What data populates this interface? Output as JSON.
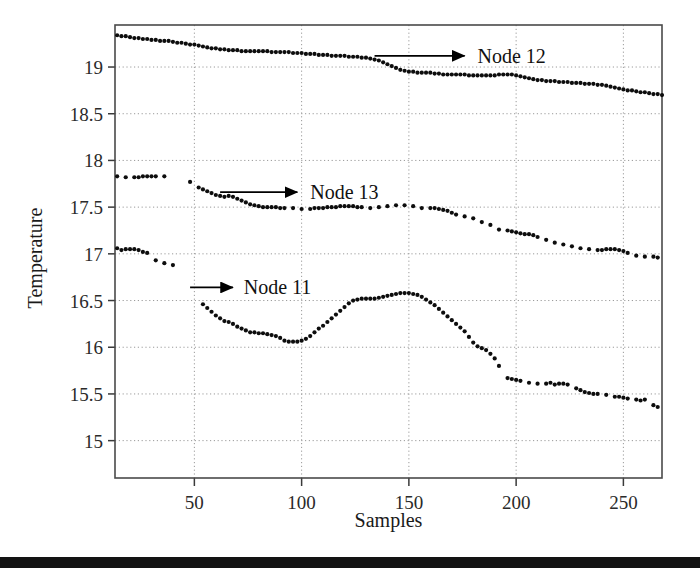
{
  "figure": {
    "background_color": "#ffffff",
    "point_color": "#0d0d0d",
    "grid_color": "#9a9a9a",
    "frame_color": "#4a4a4a"
  },
  "chart_data": {
    "type": "scatter",
    "title": "",
    "xlabel": "Samples",
    "ylabel": "Temperature",
    "xlim": [
      13,
      268
    ],
    "ylim": [
      14.6,
      19.45
    ],
    "xticks": [
      50,
      100,
      150,
      200,
      250
    ],
    "yticks": [
      15,
      15.5,
      16,
      16.5,
      17,
      17.5,
      18,
      18.5,
      19
    ],
    "xticklabels": [
      "50",
      "100",
      "150",
      "200",
      "250"
    ],
    "yticklabels": [
      "15",
      "15.5",
      "16",
      "16.5",
      "17",
      "17.5",
      "18",
      "18.5",
      "19"
    ],
    "grid": true,
    "legend": "annotations-with-arrows",
    "annotations": [
      {
        "text": "Node 12",
        "x": 182,
        "y": 19.12,
        "arrow_from_x": 134,
        "arrow_to_x": 176
      },
      {
        "text": "Node 13",
        "x": 104,
        "y": 17.66,
        "arrow_from_x": 62,
        "arrow_to_x": 98
      },
      {
        "text": "Node 11",
        "x": 73,
        "y": 16.64,
        "arrow_from_x": 48,
        "arrow_to_x": 68
      }
    ],
    "series": [
      {
        "name": "Node 12",
        "x": [
          14,
          16,
          18,
          20,
          22,
          24,
          26,
          28,
          30,
          32,
          34,
          36,
          38,
          40,
          42,
          44,
          46,
          48,
          50,
          52,
          54,
          56,
          58,
          60,
          62,
          64,
          66,
          68,
          70,
          72,
          74,
          76,
          78,
          80,
          82,
          84,
          86,
          88,
          90,
          92,
          94,
          96,
          98,
          100,
          102,
          104,
          106,
          108,
          110,
          112,
          114,
          116,
          118,
          120,
          122,
          124,
          126,
          128,
          130,
          132,
          134,
          136,
          138,
          140,
          142,
          144,
          146,
          148,
          150,
          152,
          154,
          156,
          158,
          160,
          162,
          164,
          166,
          168,
          170,
          172,
          174,
          176,
          178,
          180,
          182,
          184,
          186,
          188,
          190,
          192,
          194,
          196,
          198,
          200,
          202,
          204,
          206,
          208,
          210,
          212,
          214,
          216,
          218,
          220,
          222,
          224,
          226,
          228,
          230,
          232,
          234,
          236,
          238,
          240,
          242,
          244,
          246,
          248,
          250,
          252,
          254,
          256,
          258,
          260,
          262,
          264,
          266,
          268
        ],
        "y": [
          19.34,
          19.33,
          19.33,
          19.32,
          19.31,
          19.31,
          19.3,
          19.3,
          19.29,
          19.29,
          19.28,
          19.28,
          19.28,
          19.27,
          19.26,
          19.26,
          19.25,
          19.24,
          19.24,
          19.23,
          19.22,
          19.21,
          19.2,
          19.2,
          19.19,
          19.19,
          19.18,
          19.18,
          19.18,
          19.17,
          19.17,
          19.17,
          19.17,
          19.17,
          19.17,
          19.17,
          19.16,
          19.16,
          19.16,
          19.16,
          19.16,
          19.15,
          19.15,
          19.15,
          19.14,
          19.14,
          19.14,
          19.13,
          19.13,
          19.13,
          19.12,
          19.12,
          19.12,
          19.12,
          19.11,
          19.11,
          19.11,
          19.1,
          19.1,
          19.09,
          19.08,
          19.07,
          19.05,
          19.03,
          19.01,
          18.99,
          18.97,
          18.96,
          18.95,
          18.95,
          18.94,
          18.94,
          18.94,
          18.94,
          18.93,
          18.93,
          18.92,
          18.92,
          18.92,
          18.92,
          18.92,
          18.92,
          18.91,
          18.91,
          18.91,
          18.91,
          18.91,
          18.91,
          18.91,
          18.92,
          18.92,
          18.92,
          18.92,
          18.91,
          18.9,
          18.89,
          18.88,
          18.87,
          18.86,
          18.86,
          18.85,
          18.85,
          18.85,
          18.84,
          18.84,
          18.84,
          18.83,
          18.83,
          18.83,
          18.82,
          18.82,
          18.82,
          18.81,
          18.81,
          18.8,
          18.79,
          18.78,
          18.77,
          18.76,
          18.75,
          18.75,
          18.74,
          18.73,
          18.73,
          18.72,
          18.71,
          18.71,
          18.7
        ]
      },
      {
        "name": "Node 13",
        "x": [
          14,
          18,
          22,
          24,
          26,
          28,
          30,
          32,
          36,
          48,
          52,
          54,
          56,
          58,
          60,
          62,
          64,
          66,
          68,
          70,
          72,
          74,
          76,
          78,
          80,
          82,
          84,
          86,
          88,
          90,
          92,
          96,
          100,
          104,
          106,
          108,
          110,
          112,
          114,
          116,
          118,
          120,
          122,
          124,
          126,
          128,
          132,
          136,
          140,
          144,
          148,
          152,
          156,
          160,
          162,
          164,
          166,
          168,
          170,
          172,
          176,
          180,
          184,
          188,
          192,
          196,
          198,
          200,
          202,
          204,
          206,
          208,
          210,
          214,
          218,
          222,
          226,
          230,
          234,
          238,
          240,
          242,
          244,
          246,
          248,
          250,
          252,
          256,
          260,
          264,
          266
        ],
        "y": [
          17.83,
          17.82,
          17.82,
          17.82,
          17.83,
          17.83,
          17.83,
          17.83,
          17.83,
          17.77,
          17.71,
          17.69,
          17.67,
          17.65,
          17.63,
          17.62,
          17.61,
          17.62,
          17.61,
          17.59,
          17.57,
          17.55,
          17.53,
          17.52,
          17.51,
          17.5,
          17.5,
          17.5,
          17.5,
          17.49,
          17.49,
          17.49,
          17.48,
          17.48,
          17.49,
          17.49,
          17.49,
          17.5,
          17.5,
          17.5,
          17.51,
          17.51,
          17.51,
          17.51,
          17.5,
          17.5,
          17.49,
          17.5,
          17.51,
          17.52,
          17.52,
          17.51,
          17.49,
          17.49,
          17.49,
          17.48,
          17.47,
          17.46,
          17.44,
          17.42,
          17.4,
          17.38,
          17.34,
          17.31,
          17.26,
          17.25,
          17.24,
          17.23,
          17.22,
          17.21,
          17.21,
          17.2,
          17.18,
          17.15,
          17.12,
          17.1,
          17.08,
          17.06,
          17.05,
          17.04,
          17.04,
          17.05,
          17.05,
          17.05,
          17.04,
          17.03,
          17.01,
          16.98,
          16.97,
          16.97,
          16.96
        ]
      },
      {
        "name": "Node 11",
        "x": [
          14,
          16,
          18,
          20,
          22,
          24,
          26,
          28,
          32,
          36,
          40,
          54,
          56,
          58,
          60,
          62,
          64,
          66,
          68,
          70,
          72,
          74,
          76,
          78,
          80,
          82,
          84,
          86,
          88,
          90,
          92,
          94,
          96,
          98,
          100,
          102,
          104,
          106,
          108,
          110,
          112,
          114,
          116,
          118,
          120,
          122,
          124,
          126,
          128,
          130,
          132,
          134,
          136,
          138,
          140,
          142,
          144,
          146,
          148,
          150,
          152,
          154,
          156,
          158,
          160,
          162,
          164,
          166,
          168,
          170,
          172,
          174,
          176,
          178,
          180,
          182,
          184,
          186,
          188,
          190,
          192,
          196,
          198,
          200,
          202,
          206,
          210,
          214,
          216,
          218,
          220,
          222,
          224,
          228,
          230,
          232,
          234,
          236,
          238,
          242,
          246,
          248,
          250,
          252,
          256,
          258,
          260,
          264,
          266
        ],
        "y": [
          17.06,
          17.04,
          17.05,
          17.05,
          17.05,
          17.04,
          17.02,
          17.01,
          16.93,
          16.9,
          16.88,
          16.46,
          16.42,
          16.38,
          16.34,
          16.31,
          16.28,
          16.27,
          16.25,
          16.22,
          16.2,
          16.18,
          16.16,
          16.16,
          16.15,
          16.15,
          16.14,
          16.13,
          16.12,
          16.1,
          16.07,
          16.06,
          16.06,
          16.06,
          16.07,
          16.09,
          16.12,
          16.16,
          16.2,
          16.23,
          16.27,
          16.31,
          16.35,
          16.39,
          16.43,
          16.47,
          16.5,
          16.51,
          16.52,
          16.52,
          16.52,
          16.52,
          16.53,
          16.54,
          16.55,
          16.56,
          16.57,
          16.58,
          16.58,
          16.58,
          16.57,
          16.56,
          16.54,
          16.51,
          16.48,
          16.45,
          16.41,
          16.37,
          16.33,
          16.29,
          16.25,
          16.21,
          16.17,
          16.11,
          16.05,
          16.01,
          15.99,
          15.97,
          15.93,
          15.88,
          15.8,
          15.67,
          15.66,
          15.65,
          15.64,
          15.62,
          15.61,
          15.61,
          15.62,
          15.6,
          15.61,
          15.61,
          15.6,
          15.56,
          15.54,
          15.52,
          15.51,
          15.5,
          15.5,
          15.49,
          15.47,
          15.47,
          15.46,
          15.45,
          15.44,
          15.43,
          15.44,
          15.38,
          15.36
        ]
      }
    ]
  }
}
